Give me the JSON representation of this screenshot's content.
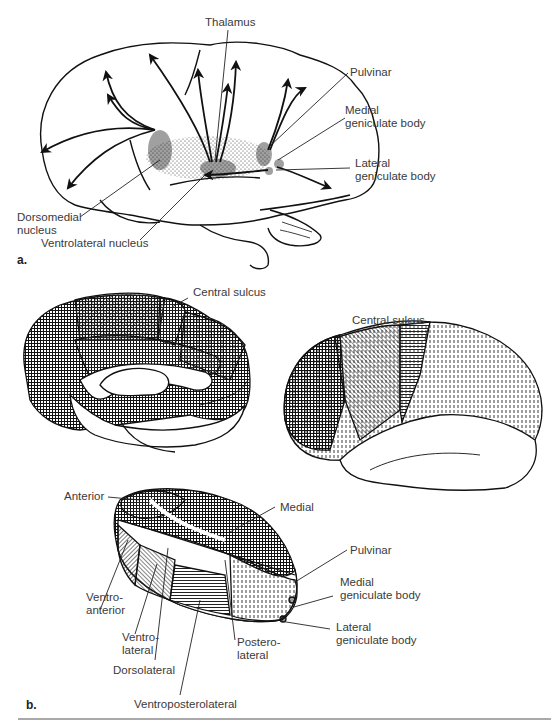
{
  "figure": {
    "panel_a": {
      "marker": "a.",
      "labels": {
        "thalamus": "Thalamus",
        "pulvinar": "Pulvinar",
        "medial_geniculate_1": "Medial",
        "medial_geniculate_2": "geniculate body",
        "lateral_geniculate_1": "Lateral",
        "lateral_geniculate_2": "geniculate body",
        "dorsomedial_1": "Dorsomedial",
        "dorsomedial_2": "nucleus",
        "ventrolateral": "Ventrolateral nucleus"
      }
    },
    "panel_b": {
      "marker": "b.",
      "labels": {
        "central_sulcus_medial": "Central sulcus",
        "central_sulcus_lateral": "Central sulcus",
        "anterior": "Anterior",
        "medial": "Medial",
        "pulvinar": "Pulvinar",
        "medial_geniculate_1": "Medial",
        "medial_geniculate_2": "geniculate body",
        "lateral_geniculate_1": "Lateral",
        "lateral_geniculate_2": "geniculate body",
        "ventroanterior_1": "Ventro-",
        "ventroanterior_2": "anterior",
        "ventrolateral_1": "Ventro-",
        "ventrolateral_2": "lateral",
        "dorsolateral": "Dorsolateral",
        "posterolateral_1": "Postero-",
        "posterolateral_2": "lateral",
        "ventroposterolateral": "Ventroposterolateral"
      }
    }
  }
}
